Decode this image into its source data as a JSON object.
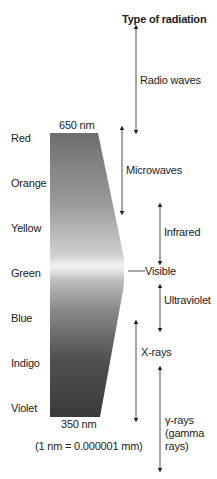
{
  "header": {
    "title": "Type of radiation"
  },
  "spectrum": {
    "top_label": "650 nm",
    "bottom_label": "350 nm",
    "note": "(1 nm  =  0.000001 mm)",
    "colors": [
      "Red",
      "Orange",
      "Yellow",
      "Green",
      "Blue",
      "Indigo",
      "Violet"
    ]
  },
  "radiation_types": [
    {
      "label": "Radio waves"
    },
    {
      "label": "Microwaves"
    },
    {
      "label": "Infrared"
    },
    {
      "label": "Visible"
    },
    {
      "label": "Ultraviolet"
    },
    {
      "label": "X-rays"
    },
    {
      "label": "γ-rays",
      "label2": "(gamma",
      "label3": "rays)"
    }
  ]
}
